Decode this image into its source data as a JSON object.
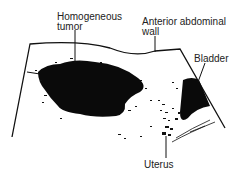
{
  "diagram": {
    "type": "ultrasound-schematic",
    "colors": {
      "ink": "#111111",
      "background": "#ffffff",
      "label": "#222222"
    },
    "labels": {
      "tumor": {
        "line1": "Homogeneous",
        "line2": "tumor"
      },
      "wall": {
        "line1": "Anterior abdominal",
        "line2": "wall"
      },
      "bladder": {
        "text": "Bladder"
      },
      "uterus": {
        "text": "Uterus"
      }
    }
  }
}
